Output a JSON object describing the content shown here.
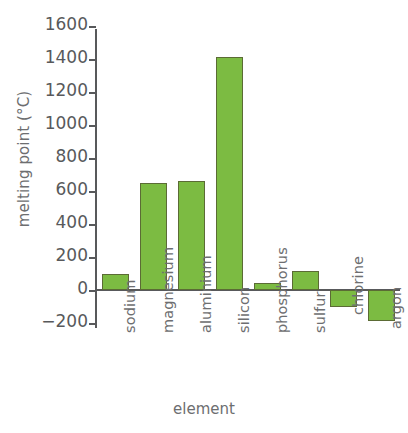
{
  "chart_data": {
    "type": "bar",
    "title": "",
    "xlabel": "element",
    "ylabel": "melting point (°C)",
    "categories": [
      "sodium",
      "magnesium",
      "aluminium",
      "silicon",
      "phosphorus",
      "sulfur",
      "chlorine",
      "argon"
    ],
    "values": [
      98,
      650,
      660,
      1410,
      44,
      115,
      -101,
      -189
    ],
    "ylim": [
      -200,
      1600
    ],
    "yticks": [
      -200,
      0,
      200,
      400,
      600,
      800,
      1000,
      1200,
      1400,
      1600
    ],
    "ytick_labels": [
      "−200",
      "0",
      "200",
      "400",
      "600",
      "800",
      "1000",
      "1200",
      "1400",
      "1600"
    ],
    "grid": false,
    "legend": false,
    "bar_color": "#7cbb42",
    "bar_edge_color": "#5b6b35",
    "axis_color": "#58595b",
    "text_color": "#6d6e70",
    "background": "#ffffff"
  }
}
